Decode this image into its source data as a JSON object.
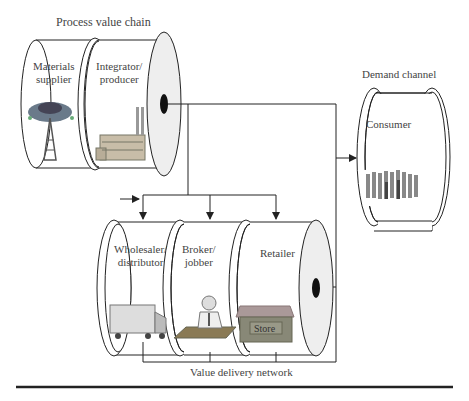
{
  "diagram": {
    "process_chain": {
      "title": "Process value chain",
      "stages": [
        {
          "label_line1": "Materials",
          "label_line2": "supplier",
          "icon": "oil-well-icon"
        },
        {
          "label_line1": "Integrator/",
          "label_line2": "producer",
          "icon": "factory-icon"
        }
      ]
    },
    "demand_channel": {
      "title": "Demand channel",
      "stages": [
        {
          "label_line1": "Consumer",
          "icon": "people-crowd-icon"
        }
      ]
    },
    "delivery_network": {
      "title": "Value delivery network",
      "stages": [
        {
          "label_line1": "Wholesaler/",
          "label_line2": "distributor",
          "icon": "truck-icon"
        },
        {
          "label_line1": "Broker/",
          "label_line2": "jobber",
          "icon": "broker-at-desk-icon"
        },
        {
          "label_line1": "Retailer",
          "icon": "store-icon",
          "store_sign": "Store"
        }
      ]
    },
    "colors": {
      "line": "#222222",
      "end_cap": "#eeeeee",
      "dot": "#111111"
    }
  }
}
